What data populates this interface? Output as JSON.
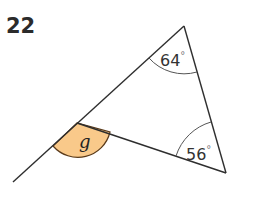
{
  "problem": {
    "number": "22"
  },
  "figure": {
    "angles": [
      {
        "id": "top",
        "value": "64",
        "unit": "°"
      },
      {
        "id": "bottom-right",
        "value": "56",
        "unit": "°"
      },
      {
        "id": "exterior",
        "variable": "g"
      }
    ],
    "colors": {
      "line": "#2e2e2e",
      "highlight_fill": "#f9c98a",
      "highlight_stroke": "#5a3a1a",
      "arc": "#555555"
    }
  }
}
